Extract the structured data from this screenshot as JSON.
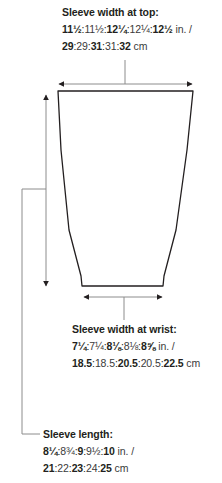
{
  "diagram": {
    "type": "sleeve-schematic",
    "colors": {
      "outline": "#231f20",
      "leader": "#8c8c8c",
      "arrow": "#231f20",
      "text": "#231f20"
    }
  },
  "sleeve_top": {
    "title": "Sleeve width at top:",
    "inches": [
      {
        "v": "11½",
        "bold": true
      },
      {
        "v": "11½",
        "bold": false
      },
      {
        "v": "12¼",
        "bold": true
      },
      {
        "v": "12¼",
        "bold": false
      },
      {
        "v": "12½",
        "bold": true
      }
    ],
    "inches_unit": " in. /",
    "cm": [
      {
        "v": "29",
        "bold": true
      },
      {
        "v": "29",
        "bold": false
      },
      {
        "v": "31",
        "bold": true
      },
      {
        "v": "31",
        "bold": false
      },
      {
        "v": "32",
        "bold": true
      }
    ],
    "cm_unit": " cm"
  },
  "sleeve_wrist": {
    "title": "Sleeve width at wrist:",
    "inches": [
      {
        "v": "7¼",
        "bold": true
      },
      {
        "v": "7¼",
        "bold": false
      },
      {
        "v": "8⅛",
        "bold": true
      },
      {
        "v": "8⅛",
        "bold": false
      },
      {
        "v": "8⅝",
        "bold": true
      }
    ],
    "inches_unit": " in. /",
    "cm": [
      {
        "v": "18.5",
        "bold": true
      },
      {
        "v": "18.5",
        "bold": false
      },
      {
        "v": "20.5",
        "bold": true
      },
      {
        "v": "20.5",
        "bold": false
      },
      {
        "v": "22.5",
        "bold": true
      }
    ],
    "cm_unit": " cm"
  },
  "sleeve_length": {
    "title": "Sleeve length:",
    "inches": [
      {
        "v": "8¼",
        "bold": true
      },
      {
        "v": "8¾",
        "bold": false
      },
      {
        "v": "9",
        "bold": true
      },
      {
        "v": "9½",
        "bold": false
      },
      {
        "v": "10",
        "bold": true
      }
    ],
    "inches_unit": " in. /",
    "cm": [
      {
        "v": "21",
        "bold": true
      },
      {
        "v": "22",
        "bold": false
      },
      {
        "v": "23",
        "bold": true
      },
      {
        "v": "24",
        "bold": false
      },
      {
        "v": "25",
        "bold": true
      }
    ],
    "cm_unit": " cm"
  }
}
